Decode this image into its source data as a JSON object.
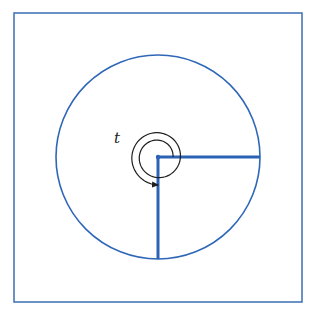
{
  "figure": {
    "angle_label": "t",
    "colors": {
      "frame": "#3a6fb5",
      "circle": "#2f67b8",
      "rays": "#2a62b6",
      "spiral": "#1e1e1e",
      "background": "#ffffff"
    },
    "frame": {
      "x": 14,
      "y": 13,
      "width": 288,
      "height": 289
    },
    "circle": {
      "cx": 158,
      "cy": 157,
      "r": 102
    },
    "initial_ray": {
      "angle_deg": 0
    },
    "terminal_ray": {
      "angle_deg": 270
    },
    "spiral": {
      "start_radius": 15,
      "end_radius": 28,
      "total_rotation_deg": 630,
      "direction": "counterclockwise"
    },
    "label_position": {
      "x": 114,
      "y": 143
    }
  }
}
